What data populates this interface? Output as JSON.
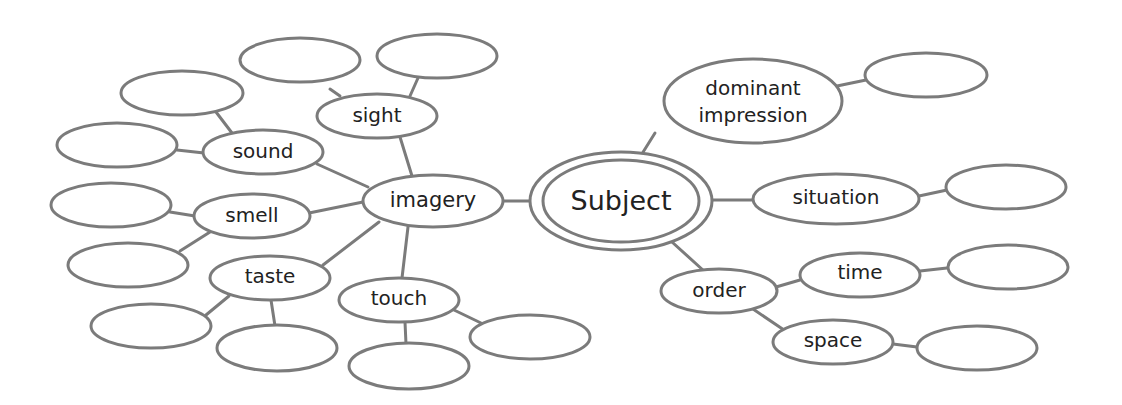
{
  "diagram": {
    "type": "cluster-map",
    "colors": {
      "stroke": "#7b7b7b",
      "text": "#222222",
      "background": "#ffffff"
    },
    "root": {
      "id": "subject",
      "label": "Subject"
    },
    "nodes": {
      "subject": "Subject",
      "imagery": "imagery",
      "sight": "sight",
      "sound": "sound",
      "smell": "smell",
      "taste": "taste",
      "touch": "touch",
      "dominant_line1": "dominant",
      "dominant_line2": "impression",
      "situation": "situation",
      "order": "order",
      "time": "time",
      "space": "space"
    },
    "edges": [
      [
        "subject",
        "imagery"
      ],
      [
        "subject",
        "dominant impression"
      ],
      [
        "subject",
        "situation"
      ],
      [
        "subject",
        "order"
      ],
      [
        "imagery",
        "sight"
      ],
      [
        "imagery",
        "sound"
      ],
      [
        "imagery",
        "smell"
      ],
      [
        "imagery",
        "taste"
      ],
      [
        "imagery",
        "touch"
      ],
      [
        "sight",
        "blank"
      ],
      [
        "sight",
        "blank"
      ],
      [
        "sound",
        "blank"
      ],
      [
        "sound",
        "blank"
      ],
      [
        "smell",
        "blank"
      ],
      [
        "smell",
        "blank"
      ],
      [
        "taste",
        "blank"
      ],
      [
        "taste",
        "blank"
      ],
      [
        "touch",
        "blank"
      ],
      [
        "touch",
        "blank"
      ],
      [
        "dominant impression",
        "blank"
      ],
      [
        "situation",
        "blank"
      ],
      [
        "order",
        "time"
      ],
      [
        "order",
        "space"
      ],
      [
        "time",
        "blank"
      ],
      [
        "space",
        "blank"
      ]
    ],
    "blank_node_count": 15
  }
}
